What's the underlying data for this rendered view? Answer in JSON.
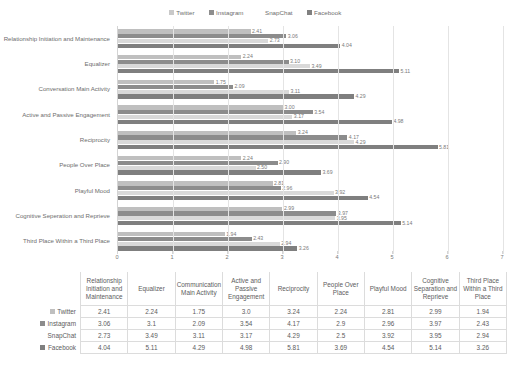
{
  "legend": {
    "items": [
      {
        "label": "Twitter",
        "color": "#c9c9c9",
        "swatch_icon": "legend-swatch-twitter"
      },
      {
        "label": "Instagram",
        "color": "#8e8e8e",
        "swatch_icon": "legend-swatch-instagram"
      },
      {
        "label": "SnapChat",
        "color": "#ffffff",
        "swatch_icon": "legend-swatch-snapchat"
      },
      {
        "label": "Facebook",
        "color": "#808080",
        "swatch_icon": "legend-swatch-facebook"
      }
    ]
  },
  "chart_data": {
    "type": "bar",
    "orientation": "horizontal",
    "title": "",
    "xlabel": "",
    "ylabel": "",
    "xlim": [
      0,
      7
    ],
    "xticks": [
      0,
      1,
      2,
      3,
      4,
      5,
      6,
      7
    ],
    "grid": true,
    "legend_position": "top-center",
    "categories": [
      "Relationship Initiation and Maintenance",
      "Equalizer",
      "Conversation Main Activity",
      "Active and Passive Engagement",
      "Reciprocity",
      "People Over Place",
      "Playful Mood",
      "Cognitive Seperation and Reprieve",
      "Third Place Within a Third Place"
    ],
    "series": [
      {
        "name": "Twitter",
        "color": "#bfbfbf",
        "values": [
          2.41,
          2.24,
          1.75,
          3.0,
          3.24,
          2.24,
          2.81,
          2.99,
          1.94
        ],
        "labels": [
          "2.41",
          "2.24",
          "1.75",
          "3.00",
          "3.24",
          "2.24",
          "2.81",
          "2.99",
          "1.94"
        ]
      },
      {
        "name": "Instagram",
        "color": "#8c8c8c",
        "values": [
          3.06,
          3.1,
          2.09,
          3.54,
          4.17,
          2.9,
          2.96,
          3.97,
          2.43
        ],
        "labels": [
          "3.06",
          "3.10",
          "2.09",
          "3.54",
          "4.17",
          "2.90",
          "2.96",
          "3.97",
          "2.43"
        ]
      },
      {
        "name": "SnapChat",
        "color": "#d9d9d9",
        "values": [
          2.73,
          3.49,
          3.11,
          3.17,
          4.29,
          2.5,
          3.92,
          3.95,
          2.94
        ],
        "labels": [
          "2.73",
          "3.49",
          "3.11",
          "3.17",
          "4.29",
          "2.50",
          "3.92",
          "3.95",
          "2.94"
        ]
      },
      {
        "name": "Facebook",
        "color": "#7f7f7f",
        "values": [
          4.04,
          5.11,
          4.29,
          4.98,
          5.81,
          3.69,
          4.54,
          5.14,
          3.26
        ],
        "labels": [
          "4.04",
          "5.11",
          "4.29",
          "4.98",
          "5.81",
          "3.69",
          "4.54",
          "5.14",
          "3.26"
        ]
      }
    ]
  },
  "table": {
    "corner_label": "",
    "columns": [
      "Relationship Initiation and Maintenance",
      "Equalizer",
      "Communication Main Activity",
      "Active and Passive Engagement",
      "Reciprocity",
      "People Over Place",
      "Playful Mood",
      "Cognitive Separation and Reprieve",
      "Third Place Within a Third Place"
    ],
    "rows": [
      {
        "series": "Twitter",
        "swatch_color": "#bfbfbf",
        "values": [
          "2.41",
          "2.24",
          "1.75",
          "3.0",
          "3.24",
          "2.24",
          "2.81",
          "2.99",
          "1.94"
        ]
      },
      {
        "series": "Instagram",
        "swatch_color": "#8c8c8c",
        "values": [
          "3.06",
          "3.1",
          "2.09",
          "3.54",
          "4.17",
          "2.9",
          "2.96",
          "3.97",
          "2.43"
        ]
      },
      {
        "series": "SnapChat",
        "swatch_color": "#ffffff",
        "values": [
          "2.73",
          "3.49",
          "3.11",
          "3.17",
          "4.29",
          "2.5",
          "3.92",
          "3.95",
          "2.94"
        ]
      },
      {
        "series": "Facebook",
        "swatch_color": "#7f7f7f",
        "values": [
          "4.04",
          "5.11",
          "4.29",
          "4.98",
          "5.81",
          "3.69",
          "4.54",
          "5.14",
          "3.26"
        ]
      }
    ]
  }
}
